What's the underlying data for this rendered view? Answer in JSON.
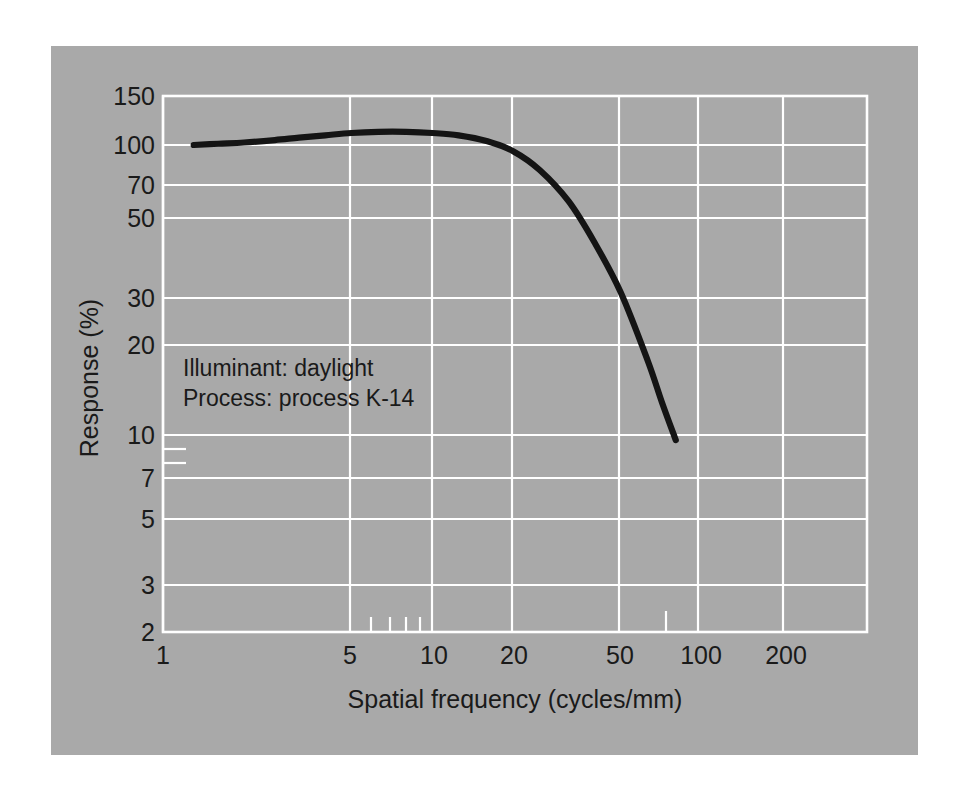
{
  "figure": {
    "background_color": "#ffffff",
    "panel_color": "#a9a9a9",
    "grid_color": "#ffffff",
    "curve_color": "#141414",
    "text_color": "#1a1a1a"
  },
  "annotations": {
    "line1": "Illuminant:  daylight",
    "line2": "Process:  process K-14"
  },
  "chart_data": {
    "type": "line",
    "title": "",
    "subtitle": "",
    "xlabel": "Spatial frequency (cycles/mm)",
    "ylabel": "Response (%)",
    "xscale": "log",
    "yscale": "log",
    "xlim": [
      1,
      300
    ],
    "ylim": [
      2,
      150
    ],
    "grid": true,
    "legend": null,
    "xticks": [
      1,
      5,
      10,
      20,
      50,
      100,
      200
    ],
    "xtick_labels": [
      "1",
      "5",
      "10",
      "20",
      "50",
      "100",
      "200"
    ],
    "x_minor_ticks": [
      6,
      7,
      8,
      9,
      70
    ],
    "yticks": [
      150,
      100,
      70,
      50,
      30,
      20,
      10,
      7,
      5,
      3,
      2
    ],
    "ytick_labels": [
      "150",
      "100",
      "70",
      "50",
      "30",
      "20",
      "10",
      "7",
      "5",
      "3",
      "2"
    ],
    "y_minor_ticks": [
      9,
      8
    ],
    "series": [
      {
        "name": "MTF response",
        "x": [
          1.3,
          1.6,
          2.0,
          2.6,
          3.2,
          4.0,
          5.0,
          6.3,
          8.0,
          10.0,
          12.5,
          16.0,
          20.0,
          25.0,
          32.0,
          40.0,
          50.0,
          63.0,
          71.0,
          80.0
        ],
        "y": [
          100,
          101,
          102,
          104,
          106,
          108,
          110,
          111,
          111,
          110,
          108,
          103,
          95,
          82,
          64,
          46,
          31,
          18,
          13,
          9.6
        ]
      }
    ],
    "annotations": [
      "Illuminant:  daylight",
      "Process:  process K-14"
    ]
  }
}
